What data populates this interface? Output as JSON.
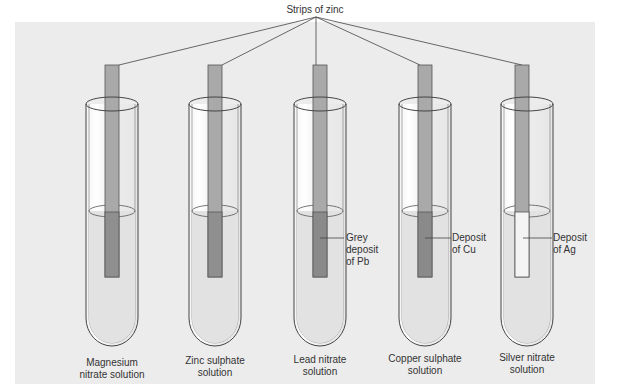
{
  "diagram": {
    "title": "Strips of zinc",
    "tubes": [
      {
        "label_line1": "Magnesium",
        "label_line2": "nitrate solution",
        "annotation": null,
        "strip_lower_color": "#8f8f8f"
      },
      {
        "label_line1": "Zinc sulphate",
        "label_line2": "solution",
        "annotation": null,
        "strip_lower_color": "#8f8f8f"
      },
      {
        "label_line1": "Lead nitrate",
        "label_line2": "solution",
        "annotation_lines": [
          "Grey",
          "deposit",
          "of Pb"
        ],
        "strip_lower_color": "#8a8a8a"
      },
      {
        "label_line1": "Copper sulphate",
        "label_line2": "solution",
        "annotation_lines": [
          "Deposit",
          "of Cu"
        ],
        "strip_lower_color": "#8a8a8a"
      },
      {
        "label_line1": "Silver nitrate",
        "label_line2": "solution",
        "annotation_lines": [
          "Deposit",
          "of Ag"
        ],
        "strip_lower_color": "#f4f4f4"
      }
    ],
    "colors": {
      "panel_bg": "#ececec",
      "strip": "#a9a9a9",
      "strip_border": "#555555",
      "tube_outline": "#444444",
      "liquid": "#e2e2e2"
    }
  }
}
